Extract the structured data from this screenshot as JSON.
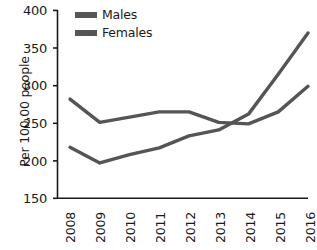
{
  "chart_data": {
    "type": "line",
    "title": "",
    "xlabel": "",
    "ylabel": "Per 100,00 people",
    "categories": [
      "2008",
      "2009",
      "2010",
      "2011",
      "2012",
      "2013",
      "2014",
      "2015",
      "2016"
    ],
    "x": [
      2008,
      2009,
      2010,
      2011,
      2012,
      2013,
      2014,
      2015,
      2016
    ],
    "ylim": [
      150,
      400
    ],
    "yticks": [
      150,
      200,
      250,
      300,
      350,
      400
    ],
    "ytick_labels": [
      "150",
      "200",
      "250",
      "300",
      "350",
      "400"
    ],
    "grid": false,
    "legend_position": "top-center",
    "series": [
      {
        "name": "Males",
        "color": "#555555",
        "values": [
          282,
          251,
          258,
          265,
          265,
          251,
          249,
          265,
          299
        ]
      },
      {
        "name": "Females",
        "color": "#555555",
        "values": [
          218,
          197,
          208,
          217,
          233,
          241,
          262,
          315,
          370
        ]
      }
    ]
  },
  "legend": {
    "items": [
      {
        "label": "Males",
        "swatch": "legend-swatch-males"
      },
      {
        "label": "Females",
        "swatch": "legend-swatch-females"
      }
    ]
  },
  "axes": {
    "y_axis_label": "Per 100,00 people",
    "y_tick_labels": [
      "400",
      "350",
      "300",
      "250",
      "200",
      "150"
    ],
    "x_tick_labels": [
      "2008",
      "2009",
      "2010",
      "2011",
      "2012",
      "2013",
      "2014",
      "2015",
      "2016"
    ]
  },
  "colors": {
    "line": "#555555",
    "axis": "#1a1a1a",
    "text": "#1a1a1a",
    "background": "#ffffff"
  }
}
